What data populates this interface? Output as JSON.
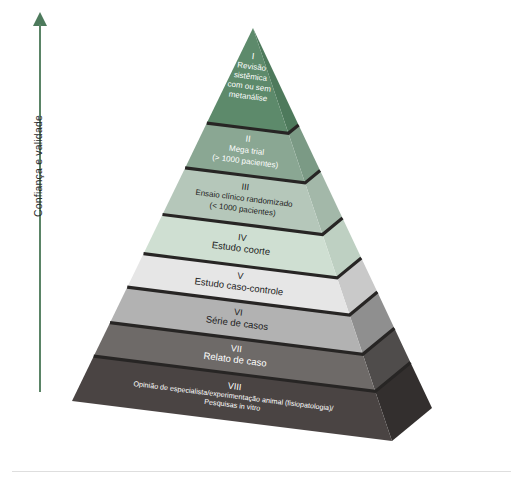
{
  "figure": {
    "type": "evidence-pyramid",
    "axis": {
      "label": "Confiança e validade",
      "arrow_direction": "up",
      "arrow_color": "#4d7a5c"
    },
    "tiers": [
      {
        "roman": "I",
        "lines": [
          "Revisão",
          "sistêmica",
          "com ou sem",
          "metanálise"
        ],
        "color": "#5d8a6b",
        "side_color": "#4e7a5c",
        "text_color": "#ffffff"
      },
      {
        "roman": "II",
        "lines": [
          "Mega trial",
          "(> 1000 pacientes)"
        ],
        "color": "#8aa793",
        "side_color": "#7b9a85",
        "text_color": "#ffffff"
      },
      {
        "roman": "III",
        "lines": [
          "Ensaio clínico randomizado",
          "(< 1000 pacientes)"
        ],
        "color": "#b5c7ba",
        "side_color": "#a3b8a9",
        "text_color": "#1d1d1d"
      },
      {
        "roman": "IV",
        "lines": [
          "Estudo coorte"
        ],
        "color": "#cfdfd2",
        "side_color": "#bed0c2",
        "text_color": "#1d1d1d"
      },
      {
        "roman": "V",
        "lines": [
          "Estudo caso-controle"
        ],
        "color": "#e6e6e6",
        "side_color": "#c9c9c9",
        "text_color": "#1d1d1d"
      },
      {
        "roman": "VI",
        "lines": [
          "Série de casos"
        ],
        "color": "#b2b2b2",
        "side_color": "#8f8f8f",
        "text_color": "#1d1d1d"
      },
      {
        "roman": "VII",
        "lines": [
          "Relato de caso"
        ],
        "color": "#6e6a68",
        "side_color": "#4f4c4b",
        "text_color": "#ffffff"
      },
      {
        "roman": "VIII",
        "lines": [
          "Opinião de especialista/experimentação animal (fisiopatologia)/",
          "Pesquisas in vitro"
        ],
        "color": "#4a4443",
        "side_color": "#332f2e",
        "text_color": "#ffffff"
      }
    ]
  }
}
